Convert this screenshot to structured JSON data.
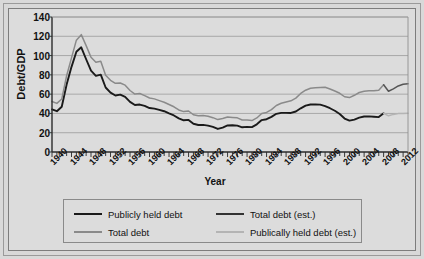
{
  "chart_data": {
    "type": "line",
    "title": "",
    "xlabel": "Year",
    "ylabel": "Debt/GDP",
    "xlim": [
      1940,
      2013
    ],
    "ylim": [
      0,
      140
    ],
    "ytick_step": 20,
    "yticks": [
      "0",
      "20",
      "40",
      "60",
      "80",
      "100",
      "120",
      "140"
    ],
    "xticks": [
      "1940",
      "1944",
      "1948",
      "1952",
      "1956",
      "1960",
      "1964",
      "1968",
      "1972",
      "1976",
      "1980",
      "1984",
      "1988",
      "1992",
      "1996",
      "2000",
      "2004",
      "2008",
      "2012"
    ],
    "xtick_minor_step": 1,
    "grid": "horizontal",
    "legend_position": "below-plot",
    "series": [
      {
        "name": "Publicly held debt",
        "color": "#1a1a1a",
        "style": "solid",
        "x": [
          1940,
          1941,
          1942,
          1943,
          1944,
          1945,
          1946,
          1947,
          1948,
          1949,
          1950,
          1951,
          1952,
          1953,
          1954,
          1955,
          1956,
          1957,
          1958,
          1959,
          1960,
          1961,
          1962,
          1963,
          1964,
          1965,
          1966,
          1967,
          1968,
          1969,
          1970,
          1971,
          1972,
          1973,
          1974,
          1975,
          1976,
          1977,
          1978,
          1979,
          1980,
          1981,
          1982,
          1983,
          1984,
          1985,
          1986,
          1987,
          1988,
          1989,
          1990,
          1991,
          1992,
          1993,
          1994,
          1995,
          1996,
          1997,
          1998,
          1999,
          2000,
          2001,
          2002,
          2003,
          2004,
          2005,
          2006,
          2007,
          2008
        ],
        "values": [
          44.2,
          42.3,
          47.0,
          70.0,
          88.3,
          103.9,
          108.6,
          96.2,
          84.3,
          79.0,
          80.2,
          66.9,
          61.6,
          58.6,
          59.5,
          57.2,
          52.0,
          48.7,
          49.2,
          47.9,
          45.6,
          45.0,
          43.7,
          42.3,
          40.0,
          37.9,
          34.9,
          32.9,
          33.3,
          29.3,
          28.0,
          28.1,
          27.4,
          26.0,
          23.9,
          25.3,
          27.5,
          27.8,
          27.4,
          25.6,
          26.1,
          25.8,
          28.7,
          33.1,
          34.0,
          36.4,
          39.6,
          40.6,
          40.6,
          40.5,
          42.0,
          45.3,
          48.1,
          49.3,
          49.2,
          49.1,
          47.6,
          45.4,
          42.8,
          39.4,
          34.7,
          32.5,
          33.6,
          35.6,
          36.8,
          36.9,
          36.5,
          36.2,
          40.2
        ]
      },
      {
        "name": "Total debt",
        "color": "#8a8a8a",
        "style": "solid",
        "x": [
          1940,
          1941,
          1942,
          1943,
          1944,
          1945,
          1946,
          1947,
          1948,
          1949,
          1950,
          1951,
          1952,
          1953,
          1954,
          1955,
          1956,
          1957,
          1958,
          1959,
          1960,
          1961,
          1962,
          1963,
          1964,
          1965,
          1966,
          1967,
          1968,
          1969,
          1970,
          1971,
          1972,
          1973,
          1974,
          1975,
          1976,
          1977,
          1978,
          1979,
          1980,
          1981,
          1982,
          1983,
          1984,
          1985,
          1986,
          1987,
          1988,
          1989,
          1990,
          1991,
          1992,
          1993,
          1994,
          1995,
          1996,
          1997,
          1998,
          1999,
          2000,
          2001,
          2002,
          2003,
          2004,
          2005,
          2006,
          2007,
          2008
        ],
        "values": [
          52.4,
          50.4,
          54.9,
          79.1,
          97.6,
          116.0,
          121.7,
          110.3,
          98.2,
          93.1,
          94.0,
          79.6,
          74.3,
          71.2,
          71.6,
          69.3,
          63.8,
          60.1,
          60.7,
          58.5,
          56.0,
          55.1,
          53.3,
          51.6,
          49.3,
          46.9,
          43.6,
          41.9,
          42.5,
          38.6,
          37.6,
          37.8,
          37.1,
          35.6,
          33.6,
          34.7,
          36.2,
          35.8,
          35.4,
          33.2,
          33.3,
          32.6,
          35.3,
          39.9,
          41.0,
          43.9,
          48.2,
          50.5,
          51.9,
          53.1,
          55.9,
          60.7,
          64.1,
          66.1,
          66.6,
          67.0,
          67.1,
          65.4,
          63.2,
          60.9,
          57.3,
          56.4,
          58.8,
          61.7,
          62.9,
          63.5,
          63.6,
          64.0,
          69.7
        ]
      },
      {
        "name": "Total debt (est.)",
        "color": "#555555",
        "style": "solid",
        "x": [
          2008,
          2009,
          2010,
          2011,
          2012,
          2013
        ],
        "values": [
          69.7,
          63.0,
          65.5,
          68.5,
          70.2,
          70.8
        ]
      },
      {
        "name": "Publically held debt (est.)",
        "color": "#b4b4b4",
        "style": "solid",
        "x": [
          2008,
          2009,
          2010,
          2011,
          2012,
          2013
        ],
        "values": [
          40.2,
          37.5,
          39.0,
          39.8,
          40.0,
          40.2
        ]
      }
    ],
    "legend_entries": [
      {
        "label": "Publicly held debt",
        "color": "#1a1a1a"
      },
      {
        "label": "Total debt",
        "color": "#8a8a8a"
      },
      {
        "label": "Total debt (est.)",
        "color": "#333333"
      },
      {
        "label": "Publically held debt (est.)",
        "color": "#b4b4b4"
      }
    ]
  }
}
